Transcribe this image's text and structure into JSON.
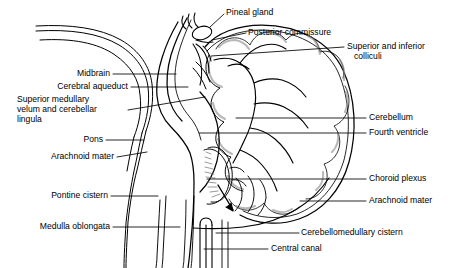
{
  "figure": {
    "type": "anatomical-diagram",
    "style": "black-and-white line drawing",
    "background_color": "#ffffff",
    "line_color": "#000000",
    "shading_color": "#8d8d8d",
    "width": 467,
    "height": 268
  },
  "labels": {
    "pineal_gland": "Pineal gland",
    "posterior_commissure": "Posterior commissure",
    "superior_inferior_colliculi_line1": "Superior and inferior",
    "superior_inferior_colliculi_line2": "colliculi",
    "midbrain": "Midbrain",
    "cerebral_aqueduct": "Cerebral aqueduct",
    "superior_medullary_velum_line1": "Superior medullary",
    "superior_medullary_velum_line2": "velum and cerebellar",
    "superior_medullary_velum_line3": "lingula",
    "pons": "Pons",
    "arachnoid_mater_left": "Arachnoid mater",
    "pontine_cistern": "Pontine cistern",
    "medulla_oblongata": "Medulla oblongata",
    "cerebellum": "Cerebellum",
    "fourth_ventricle": "Fourth ventricle",
    "choroid_plexus": "Choroid plexus",
    "arachnoid_mater_right": "Arachnoid mater",
    "cerebellomedullary_cistern": "Cerebellomedullary cistern",
    "central_canal": "Central canal"
  }
}
